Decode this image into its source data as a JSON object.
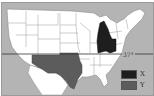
{
  "map": {
    "title": "",
    "region": "Contiguous United States",
    "latitude_line": {
      "label": "37°"
    },
    "colors": {
      "background": "#b4b4b4",
      "states": "#ffffff",
      "borders": "#8a8a8a",
      "region_x": "#1e1e1e",
      "region_y": "#5c5c5c"
    },
    "shaded_regions": [
      {
        "label": "X",
        "states": [
          "Michigan",
          "Indiana",
          "Ohio"
        ]
      },
      {
        "label": "Y",
        "states": [
          "Arizona",
          "New Mexico",
          "Texas",
          "Oklahoma"
        ]
      }
    ]
  },
  "legend": {
    "items": [
      {
        "label": "X",
        "color": "#1e1e1e"
      },
      {
        "label": "Y",
        "color": "#5c5c5c"
      }
    ]
  }
}
